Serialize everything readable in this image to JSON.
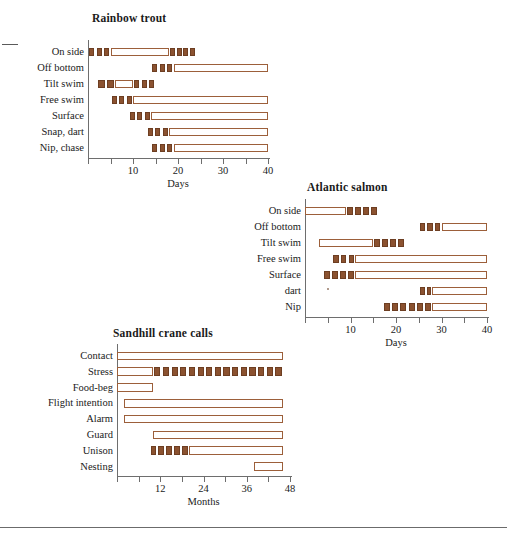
{
  "page": {
    "background_color": "#ffffff",
    "filled_color": "#8b5230",
    "outline_color": "#9c5f3a",
    "axis_color": "#6e6e6e"
  },
  "charts": [
    {
      "id": "rainbow-trout",
      "title": "Rainbow trout",
      "xlabel": "Days",
      "xmin": 0,
      "xmax": 40,
      "tick_step": 5,
      "tick_labels": [
        {
          "value": 10,
          "label": "10"
        },
        {
          "value": 20,
          "label": "20"
        },
        {
          "value": 30,
          "label": "30"
        },
        {
          "value": 40,
          "label": "40"
        }
      ],
      "rows": [
        {
          "label": "On side",
          "segments": [
            {
              "type": "dotted",
              "start": 0,
              "end": 5,
              "count": 3
            },
            {
              "type": "open",
              "start": 5,
              "end": 18
            },
            {
              "type": "dotted",
              "start": 18,
              "end": 24,
              "count": 4
            }
          ]
        },
        {
          "label": "Off bottom",
          "segments": [
            {
              "type": "dotted",
              "start": 14,
              "end": 19,
              "count": 3
            },
            {
              "type": "open",
              "start": 19,
              "end": 40
            }
          ]
        },
        {
          "label": "Tilt swim",
          "segments": [
            {
              "type": "dotted",
              "start": 2,
              "end": 6,
              "count": 2
            },
            {
              "type": "open",
              "start": 6,
              "end": 10
            },
            {
              "type": "dotted",
              "start": 10,
              "end": 15,
              "count": 3
            }
          ]
        },
        {
          "label": "Free swim",
          "segments": [
            {
              "type": "dotted",
              "start": 5,
              "end": 10,
              "count": 3
            },
            {
              "type": "open",
              "start": 10,
              "end": 40
            }
          ]
        },
        {
          "label": "Surface",
          "segments": [
            {
              "type": "dotted",
              "start": 9,
              "end": 14,
              "count": 3
            },
            {
              "type": "open",
              "start": 14,
              "end": 40
            }
          ]
        },
        {
          "label": "Snap, dart",
          "segments": [
            {
              "type": "dotted",
              "start": 13,
              "end": 18,
              "count": 3
            },
            {
              "type": "open",
              "start": 18,
              "end": 40
            }
          ]
        },
        {
          "label": "Nip, chase",
          "segments": [
            {
              "type": "dotted",
              "start": 14,
              "end": 19,
              "count": 3
            },
            {
              "type": "open",
              "start": 19,
              "end": 40
            }
          ]
        }
      ]
    },
    {
      "id": "atlantic-salmon",
      "title": "Atlantic salmon",
      "xlabel": "Days",
      "xmin": 0,
      "xmax": 40,
      "tick_step": 5,
      "tick_labels": [
        {
          "value": 10,
          "label": "10"
        },
        {
          "value": 20,
          "label": "20"
        },
        {
          "value": 30,
          "label": "30"
        },
        {
          "value": 40,
          "label": "40"
        }
      ],
      "rows": [
        {
          "label": "On side",
          "segments": [
            {
              "type": "open",
              "start": 0,
              "end": 9
            },
            {
              "type": "dotted",
              "start": 9,
              "end": 16,
              "count": 4
            }
          ]
        },
        {
          "label": "Off bottom",
          "segments": [
            {
              "type": "dotted",
              "start": 25,
              "end": 30,
              "count": 3
            },
            {
              "type": "open",
              "start": 30,
              "end": 40
            }
          ]
        },
        {
          "label": "Tilt swim",
          "segments": [
            {
              "type": "open",
              "start": 3,
              "end": 15
            },
            {
              "type": "dotted",
              "start": 15,
              "end": 22,
              "count": 4
            }
          ]
        },
        {
          "label": "Free swim",
          "segments": [
            {
              "type": "dotted",
              "start": 6,
              "end": 11,
              "count": 3
            },
            {
              "type": "open",
              "start": 11,
              "end": 40
            }
          ]
        },
        {
          "label": "Surface",
          "segments": [
            {
              "type": "dotted",
              "start": 4,
              "end": 11,
              "count": 4
            },
            {
              "type": "open",
              "start": 11,
              "end": 40
            }
          ]
        },
        {
          "label": "dart",
          "segments": [
            {
              "type": "dotted",
              "start": 25,
              "end": 28,
              "count": 2
            },
            {
              "type": "open",
              "start": 28,
              "end": 40
            }
          ]
        },
        {
          "label": "Nip",
          "segments": [
            {
              "type": "dotted",
              "start": 17,
              "end": 28,
              "count": 6
            },
            {
              "type": "open",
              "start": 28,
              "end": 40
            }
          ]
        }
      ]
    },
    {
      "id": "sandhill-crane-calls",
      "title": "Sandhill crane calls",
      "xlabel": "Months",
      "xmin": 0,
      "xmax": 48,
      "tick_step": 6,
      "tick_labels": [
        {
          "value": 12,
          "label": "12"
        },
        {
          "value": 24,
          "label": "24"
        },
        {
          "value": 36,
          "label": "36"
        },
        {
          "value": 48,
          "label": "48"
        }
      ],
      "rows": [
        {
          "label": "Contact",
          "segments": [
            {
              "type": "open",
              "start": 0,
              "end": 46
            }
          ]
        },
        {
          "label": "Stress",
          "segments": [
            {
              "type": "open",
              "start": 0,
              "end": 10
            },
            {
              "type": "dotted",
              "start": 10,
              "end": 46,
              "count": 15
            }
          ]
        },
        {
          "label": "Food-beg",
          "segments": [
            {
              "type": "open",
              "start": 0,
              "end": 10
            }
          ]
        },
        {
          "label": "Flight intention",
          "segments": [
            {
              "type": "open",
              "start": 2,
              "end": 46
            }
          ]
        },
        {
          "label": "Alarm",
          "segments": [
            {
              "type": "open",
              "start": 2,
              "end": 46
            }
          ]
        },
        {
          "label": "Guard",
          "segments": [
            {
              "type": "open",
              "start": 10,
              "end": 46
            }
          ]
        },
        {
          "label": "Unison",
          "segments": [
            {
              "type": "dotted",
              "start": 9,
              "end": 20,
              "count": 5
            },
            {
              "type": "open",
              "start": 20,
              "end": 46
            }
          ]
        },
        {
          "label": "Nesting",
          "segments": [
            {
              "type": "open",
              "start": 38,
              "end": 46
            }
          ]
        }
      ]
    }
  ]
}
